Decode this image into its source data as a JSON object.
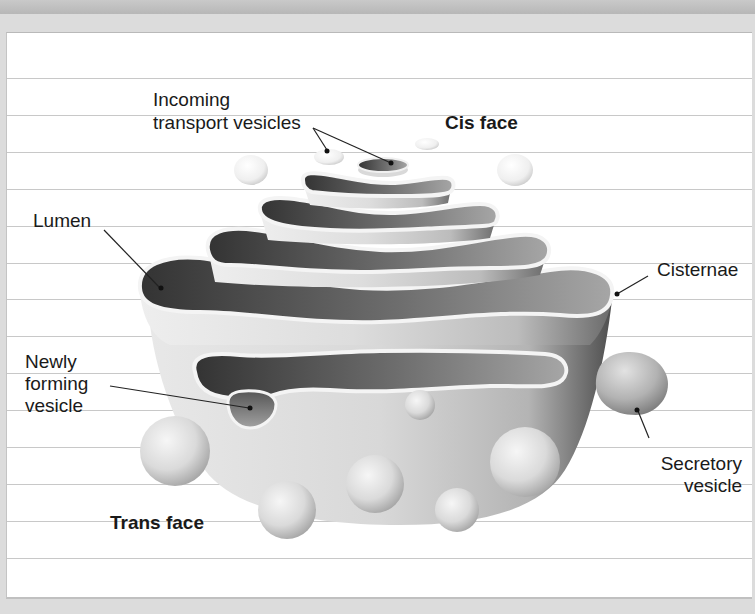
{
  "diagram": {
    "labels": {
      "incoming_line1": "Incoming",
      "incoming_line2": "transport vesicles",
      "cis_face": "Cis face",
      "lumen": "Lumen",
      "cisternae": "Cisternae",
      "newly_line1": "Newly",
      "newly_line2": "forming",
      "newly_line3": "vesicle",
      "secretory_line1": "Secretory",
      "secretory_line2": "vesicle",
      "trans_face": "Trans face"
    },
    "colors": {
      "paper": "#ffffff",
      "rule_line": "#c8c8c8",
      "frame": "#dcdcdc",
      "lumen_dark": "#3a3a3a",
      "lumen_light": "#9a9a9a",
      "membrane": "#f2f2f2",
      "body_gray": "#d4d4d4",
      "label_text": "#1a1a1a"
    },
    "rule_lines_y": [
      78,
      115,
      152,
      189,
      226,
      263,
      299,
      336,
      373,
      410,
      447,
      484,
      521,
      558
    ]
  }
}
